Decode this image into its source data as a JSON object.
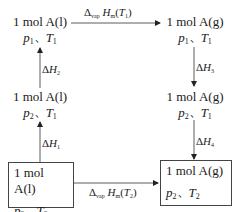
{
  "diagram": {
    "type": "thermodynamic-cycle",
    "nodes": {
      "top_left": {
        "substance": "1 mol A(l)",
        "p": "p",
        "p_sub": "1",
        "sep": "、",
        "T": "T",
        "T_sub": "1",
        "boxed": false
      },
      "top_right": {
        "substance": "1 mol A(g)",
        "p": "p",
        "p_sub": "1",
        "sep": "、",
        "T": "T",
        "T_sub": "1",
        "boxed": false
      },
      "mid_left": {
        "substance": "1 mol A(l)",
        "p": "p",
        "p_sub": "2",
        "sep": "、",
        "T": "T",
        "T_sub": "1",
        "boxed": false
      },
      "mid_right": {
        "substance": "1 mol A(g)",
        "p": "p",
        "p_sub": "2",
        "sep": "、",
        "T": "T",
        "T_sub": "1",
        "boxed": false
      },
      "bottom_left": {
        "substance": "1 mol A(l)",
        "p": "p",
        "p_sub": "2",
        "sep": "、",
        "T": "T",
        "T_sub": "2",
        "boxed": true
      },
      "bottom_right": {
        "substance": "1 mol A(g)",
        "p": "p",
        "p_sub": "2",
        "sep": "、",
        "T": "T",
        "T_sub": "2",
        "boxed": true
      }
    },
    "edges": {
      "top": {
        "from": "top_left",
        "to": "top_right",
        "delta": "Δ",
        "delta_sub": "vap",
        "H": "H",
        "H_sub": "m",
        "open": "(",
        "T": "T",
        "T_sub": "1",
        "close": ")"
      },
      "bottom": {
        "from": "bottom_left",
        "to": "bottom_right",
        "delta": "Δ",
        "delta_sub": "vap",
        "H": "H",
        "H_sub": "m",
        "open": "(",
        "T": "T",
        "T_sub": "2",
        "close": ")"
      },
      "left_lower": {
        "from": "bottom_left",
        "to": "mid_left",
        "delta": "Δ",
        "H": "H",
        "H_sub": "1"
      },
      "left_upper": {
        "from": "mid_left",
        "to": "top_left",
        "delta": "Δ",
        "H": "H",
        "H_sub": "2"
      },
      "right_upper": {
        "from": "top_right",
        "to": "mid_right",
        "delta": "Δ",
        "H": "H",
        "H_sub": "3"
      },
      "right_lower": {
        "from": "mid_right",
        "to": "bottom_right",
        "delta": "Δ",
        "H": "H",
        "H_sub": "4"
      }
    },
    "colors": {
      "line": "#333333",
      "text": "#1a1a1a",
      "box_border": "#444444"
    }
  }
}
